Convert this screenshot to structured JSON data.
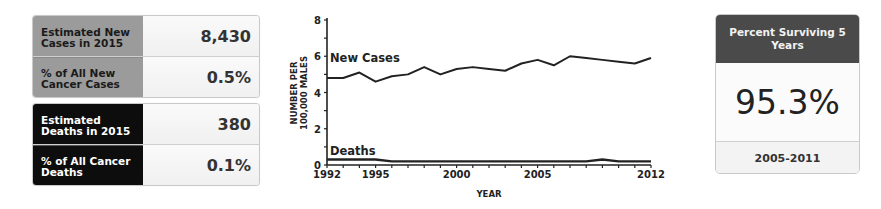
{
  "stats": {
    "new_cases": {
      "rows": [
        {
          "label": "Estimated New Cases in 2015",
          "value": "8,430"
        },
        {
          "label": "% of All New Cancer Cases",
          "value": "0.5%"
        }
      ]
    },
    "deaths": {
      "rows": [
        {
          "label": "Estimated Deaths in 2015",
          "value": "380"
        },
        {
          "label": "% of All Cancer Deaths",
          "value": "0.1%"
        }
      ]
    }
  },
  "survival": {
    "title": "Percent Surviving 5 Years",
    "value": "95.3%",
    "period": "2005-2011"
  },
  "chart_data": {
    "type": "line",
    "title": "",
    "xlabel": "YEAR",
    "ylabel": "NUMBER PER 100,000 MALES",
    "ylim": [
      0,
      8
    ],
    "xlim": [
      1992,
      2012
    ],
    "yticks": [
      0,
      2,
      4,
      6,
      8
    ],
    "xtick_labels": [
      "1992",
      "1995",
      "2000",
      "2005",
      "2012"
    ],
    "grid": false,
    "x": [
      1992,
      1993,
      1994,
      1995,
      1996,
      1997,
      1998,
      1999,
      2000,
      2001,
      2002,
      2003,
      2004,
      2005,
      2006,
      2007,
      2008,
      2009,
      2010,
      2011,
      2012
    ],
    "series": [
      {
        "name": "New Cases",
        "values": [
          4.8,
          4.8,
          5.1,
          4.6,
          4.9,
          5.0,
          5.4,
          5.0,
          5.3,
          5.4,
          5.3,
          5.2,
          5.6,
          5.8,
          5.5,
          6.0,
          5.9,
          5.8,
          5.7,
          5.6,
          5.9
        ]
      },
      {
        "name": "Deaths",
        "values": [
          0.3,
          0.3,
          0.3,
          0.3,
          0.2,
          0.2,
          0.2,
          0.2,
          0.2,
          0.2,
          0.2,
          0.2,
          0.2,
          0.2,
          0.2,
          0.2,
          0.2,
          0.3,
          0.2,
          0.2,
          0.2
        ]
      }
    ],
    "annotations": [
      "New Cases",
      "Deaths"
    ]
  }
}
